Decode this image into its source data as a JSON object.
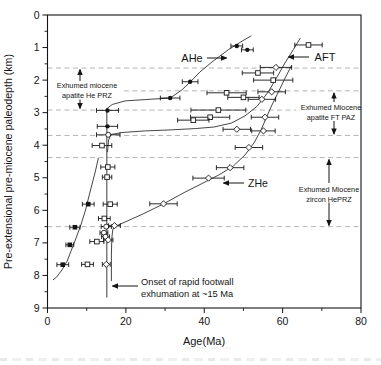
{
  "chart_data": {
    "type": "scatter",
    "title": "",
    "xlabel": "Age(Ma)",
    "ylabel": "Pre-extensional pre-miocene paleodepth (km)",
    "xlim": [
      0,
      80
    ],
    "ylim": [
      9,
      0
    ],
    "y_axis_inverted": true,
    "x_ticks_major": [
      0,
      20,
      40,
      60,
      80
    ],
    "x_ticks_minor": [
      10,
      30,
      50,
      70
    ],
    "y_ticks_major": [
      0,
      1,
      2,
      3,
      4,
      5,
      6,
      7,
      8,
      9
    ],
    "y_ticks_minor": [
      0.5,
      1.5,
      2.5,
      3.5,
      4.5,
      5.5,
      6.5,
      7.5,
      8.5
    ],
    "grid": "off",
    "dashed_lines": [
      {
        "depth": 1.63,
        "age_from": 0,
        "age_to": 80
      },
      {
        "depth": 2.33,
        "age_from": 19.5,
        "age_to": 80
      },
      {
        "depth": 2.92,
        "age_from": 0,
        "age_to": 63.5
      },
      {
        "depth": 3.7,
        "age_from": 0,
        "age_to": 80
      },
      {
        "depth": 4.38,
        "age_from": 0,
        "age_to": 80
      },
      {
        "depth": 6.5,
        "age_from": 0,
        "age_to": 80
      }
    ],
    "onset_line": {
      "age": 15.14,
      "depth_from": 2.86,
      "depth_to": 8.68
    },
    "series": [
      {
        "name": "AHe (shallow limb)",
        "marker": "circle",
        "filled": true,
        "points": [
          [
            48.3,
            0.95,
            1.5
          ],
          [
            51.0,
            1.07,
            1.5
          ],
          [
            36.4,
            2.05,
            2.0
          ],
          [
            31.3,
            2.55,
            2.5
          ],
          [
            15.3,
            2.93,
            2.8
          ],
          [
            15.3,
            3.42,
            2.6
          ]
        ]
      },
      {
        "name": "AHe (deep limb)",
        "marker": "square",
        "filled": true,
        "points": [
          [
            10.4,
            5.81,
            1.5
          ],
          [
            7.0,
            6.52,
            1.3
          ],
          [
            5.7,
            7.06,
            1.0
          ],
          [
            3.9,
            7.67,
            1.5
          ]
        ]
      },
      {
        "name": "AFT",
        "marker": "square",
        "filled": false,
        "points": [
          [
            66.6,
            0.92,
            3.5
          ],
          [
            53.7,
            1.78,
            4.0
          ],
          [
            57.6,
            2.0,
            5.0
          ],
          [
            45.7,
            2.39,
            5.0
          ],
          [
            50.0,
            2.53,
            4.0
          ],
          [
            43.6,
            2.92,
            7.0
          ],
          [
            41.5,
            3.14,
            5.0
          ],
          [
            37.2,
            3.23,
            4.0
          ],
          [
            13.9,
            4.01,
            2.5
          ],
          [
            15.4,
            4.67,
            1.8
          ],
          [
            15.2,
            4.98,
            1.2
          ],
          [
            16.0,
            5.81,
            1.8
          ],
          [
            14.5,
            6.25,
            1.5
          ],
          [
            12.6,
            6.96,
            1.8
          ],
          [
            10.2,
            7.66,
            1.5
          ]
        ]
      },
      {
        "name": "AFT (circle symbols)",
        "marker": "circle",
        "filled": false,
        "points": [
          [
            15.5,
            3.68,
            3.0
          ],
          [
            15.0,
            6.5,
            1.3
          ],
          [
            14.4,
            6.69,
            1.0
          ],
          [
            14.8,
            6.81,
            1.0
          ]
        ]
      },
      {
        "name": "ZHe",
        "marker": "diamond",
        "filled": false,
        "points": [
          [
            58.3,
            1.61,
            4.0
          ],
          [
            57.2,
            2.36,
            3.5
          ],
          [
            54.7,
            2.59,
            3.5
          ],
          [
            55.5,
            3.14,
            3.5
          ],
          [
            48.3,
            3.51,
            3.5
          ],
          [
            55.1,
            3.56,
            3.0
          ],
          [
            51.4,
            4.07,
            3.5
          ],
          [
            46.6,
            4.69,
            3.5
          ],
          [
            41.1,
            5.01,
            4.0
          ],
          [
            29.6,
            5.8,
            3.5
          ],
          [
            17.1,
            6.47,
            1.5
          ],
          [
            15.5,
            6.91,
            1.2
          ],
          [
            15.0,
            7.66,
            1.0
          ]
        ]
      }
    ],
    "curves": [
      {
        "name": "AHe fit",
        "points": [
          [
            52.0,
            0.64
          ],
          [
            49.7,
            0.8
          ],
          [
            46.1,
            1.07
          ],
          [
            42.0,
            1.44
          ],
          [
            38.9,
            1.75
          ],
          [
            36.4,
            2.06
          ],
          [
            34.3,
            2.3
          ],
          [
            31.3,
            2.55
          ],
          [
            24.9,
            2.6
          ],
          [
            19.8,
            2.64
          ],
          [
            16.5,
            2.75
          ],
          [
            15.3,
            2.86
          ],
          [
            15.15,
            3.01
          ]
        ]
      },
      {
        "name": "AFT fit",
        "points": [
          [
            64.5,
            0.71
          ],
          [
            62.7,
            1.07
          ],
          [
            60.6,
            1.47
          ],
          [
            58.6,
            1.9
          ],
          [
            56.3,
            2.37
          ],
          [
            53.5,
            2.8
          ],
          [
            50.4,
            3.1
          ],
          [
            46.9,
            3.32
          ],
          [
            42.5,
            3.44
          ],
          [
            37.7,
            3.49
          ],
          [
            31.3,
            3.53
          ],
          [
            24.9,
            3.56
          ],
          [
            19.0,
            3.61
          ],
          [
            16.2,
            3.67
          ],
          [
            15.6,
            3.84
          ],
          [
            15.3,
            4.21
          ]
        ]
      },
      {
        "name": "ZHe fit",
        "points": [
          [
            62.2,
            1.57
          ],
          [
            60.6,
            1.94
          ],
          [
            58.9,
            2.37
          ],
          [
            57.3,
            2.76
          ],
          [
            55.8,
            3.16
          ],
          [
            54.5,
            3.53
          ],
          [
            52.7,
            3.93
          ],
          [
            50.4,
            4.3
          ],
          [
            47.4,
            4.64
          ],
          [
            43.8,
            4.91
          ],
          [
            39.7,
            5.16
          ],
          [
            35.1,
            5.44
          ],
          [
            29.5,
            5.81
          ],
          [
            24.4,
            6.11
          ],
          [
            20.3,
            6.33
          ],
          [
            17.7,
            6.47
          ],
          [
            16.7,
            6.57
          ],
          [
            16.4,
            6.85
          ],
          [
            16.3,
            7.37
          ],
          [
            16.3,
            8.17
          ]
        ]
      },
      {
        "name": "AHe deep fit",
        "points": [
          [
            13.0,
            4.39
          ],
          [
            12.3,
            4.76
          ],
          [
            11.5,
            5.13
          ],
          [
            10.6,
            5.56
          ],
          [
            9.7,
            5.99
          ],
          [
            8.6,
            6.42
          ],
          [
            7.3,
            6.85
          ],
          [
            6.1,
            7.22
          ],
          [
            5.0,
            7.56
          ],
          [
            3.7,
            7.83
          ],
          [
            2.3,
            8.05
          ],
          [
            1.4,
            8.14
          ]
        ]
      }
    ],
    "annotations": {
      "labels": [
        {
          "id": "ahe-label",
          "lines": [
            "AHe"
          ],
          "x": 192,
          "y": 61.5,
          "size": 11,
          "lh": 12,
          "anchor": "middle"
        },
        {
          "id": "aft-label",
          "lines": [
            "AFT"
          ],
          "x": 325,
          "y": 60.5,
          "size": 11,
          "lh": 12,
          "anchor": "middle"
        },
        {
          "id": "zhe-label",
          "lines": [
            "ZHe"
          ],
          "x": 258,
          "y": 186.5,
          "size": 10.5,
          "lh": 12,
          "anchor": "middle"
        },
        {
          "id": "he-prz-note",
          "lines": [
            "Exhumed miocene",
            "apatite He PRZ"
          ],
          "x": 87,
          "y": 88,
          "size": 7.3,
          "lh": 9.5,
          "anchor": "middle"
        },
        {
          "id": "ft-paz-note",
          "lines": [
            "Exhumed Miocene",
            "apatite FT PAZ"
          ],
          "x": 331,
          "y": 110,
          "size": 7.3,
          "lh": 9.5,
          "anchor": "middle"
        },
        {
          "id": "zircon-prz-note",
          "lines": [
            "Exhumed Miocene",
            "zircon HePRZ"
          ],
          "x": 329,
          "y": 192,
          "size": 7.3,
          "lh": 9.5,
          "anchor": "middle"
        },
        {
          "id": "onset-note",
          "lines": [
            "Onset of rapid footwall",
            "exhumation at ~15 Ma"
          ],
          "x": 141,
          "y": 284.5,
          "size": 9.3,
          "lh": 12,
          "anchor": "start"
        }
      ],
      "arrows": [
        {
          "id": "he-prz-up",
          "x1": 80,
          "y1": 81,
          "x2": 80,
          "y2": 69.5
        },
        {
          "id": "he-prz-down",
          "x1": 80,
          "y1": 99.5,
          "x2": 80,
          "y2": 108.5
        },
        {
          "id": "ft-paz-up",
          "x1": 334,
          "y1": 102,
          "x2": 334,
          "y2": 93
        },
        {
          "id": "ft-paz-down",
          "x1": 334,
          "y1": 121,
          "x2": 334,
          "y2": 134
        },
        {
          "id": "zircon-up",
          "x1": 329,
          "y1": 183,
          "x2": 329,
          "y2": 159.5
        },
        {
          "id": "zircon-down",
          "x1": 329,
          "y1": 202.5,
          "x2": 329,
          "y2": 225.5
        },
        {
          "id": "onset-arrow",
          "x1": 138,
          "y1": 286,
          "x2": 112.5,
          "y2": 286
        },
        {
          "id": "ahe-arrow",
          "x1": 207,
          "y1": 58,
          "x2": 226.5,
          "y2": 58
        },
        {
          "id": "aft-arrow",
          "x1": 309,
          "y1": 57,
          "x2": 288.5,
          "y2": 57
        },
        {
          "id": "zhe-arrow",
          "x1": 244,
          "y1": 183,
          "x2": 223.5,
          "y2": 183
        }
      ]
    },
    "colors": {
      "ink": "#141414",
      "curve": "#3c3c3c",
      "dashed": "#adadad",
      "marker_open_fill": "#ffffff"
    }
  }
}
